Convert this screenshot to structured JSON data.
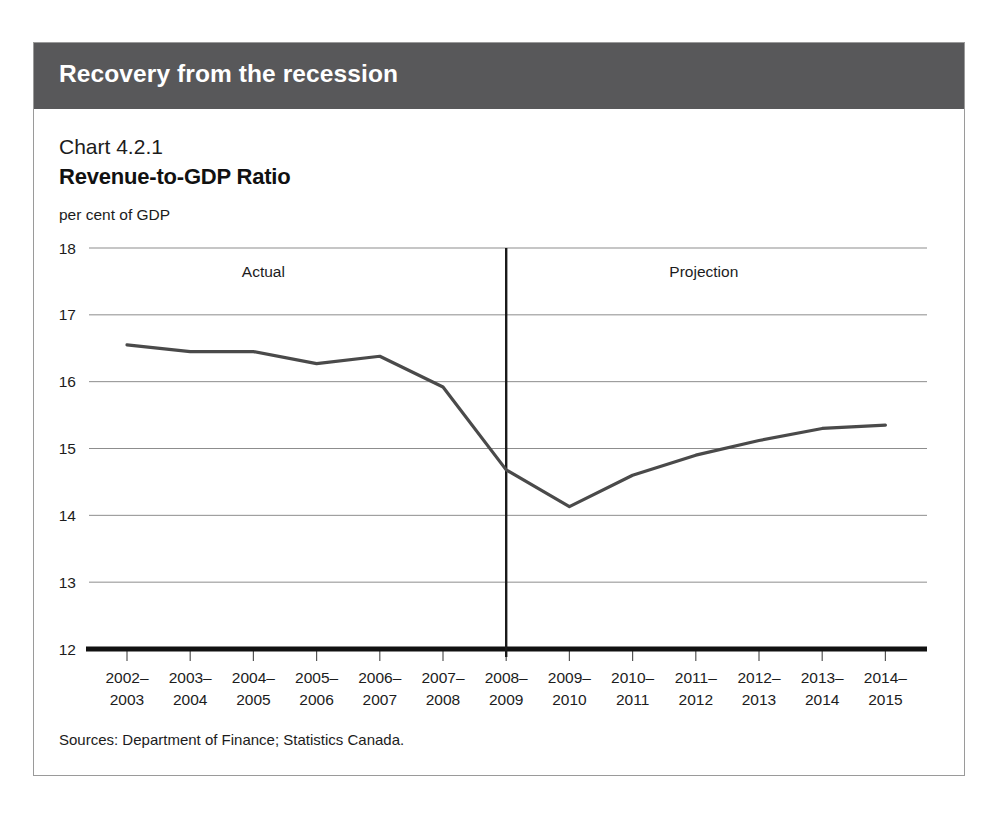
{
  "header": {
    "banner_title": "Recovery from the recession",
    "banner_color": "#58585a"
  },
  "chart": {
    "number": "Chart 4.2.1",
    "title": "Revenue-to-GDP Ratio",
    "units": "per cent of GDP",
    "source_note": "Sources: Department of Finance; Statistics Canada."
  },
  "chart_data": {
    "type": "line",
    "title": "Revenue-to-GDP Ratio",
    "subtitle": "Chart 4.2.1",
    "xlabel": "",
    "ylabel": "per cent of GDP",
    "ylim": [
      12,
      18
    ],
    "yticks": [
      "12",
      "13",
      "14",
      "15",
      "16",
      "17",
      "18"
    ],
    "grid": true,
    "legend": "none",
    "line_color": "#4a4a4a",
    "categories": [
      "2002–\n2003",
      "2003–\n2004",
      "2004–\n2005",
      "2005–\n2006",
      "2006–\n2007",
      "2007–\n2008",
      "2008–\n2009",
      "2009–\n2010",
      "2010–\n2011",
      "2011–\n2012",
      "2012–\n2013",
      "2013–\n2014",
      "2014–\n2015"
    ],
    "categories_line1": [
      "2002–",
      "2003–",
      "2004–",
      "2005–",
      "2006–",
      "2007–",
      "2008–",
      "2009–",
      "2010–",
      "2011–",
      "2012–",
      "2013–",
      "2014–"
    ],
    "categories_line2": [
      "2003",
      "2004",
      "2005",
      "2006",
      "2007",
      "2008",
      "2009",
      "2010",
      "2011",
      "2012",
      "2013",
      "2014",
      "2015"
    ],
    "values": [
      16.55,
      16.45,
      16.45,
      16.27,
      16.38,
      15.92,
      14.68,
      14.13,
      14.6,
      14.9,
      15.12,
      15.3,
      15.35
    ],
    "annotations": [
      {
        "text": "Actual",
        "at_category": "2004–2005"
      },
      {
        "text": "Projection",
        "at_category": "2011–2012"
      }
    ],
    "divider": {
      "at_category": "2008–2009",
      "label_left": "Actual",
      "label_right": "Projection"
    }
  }
}
